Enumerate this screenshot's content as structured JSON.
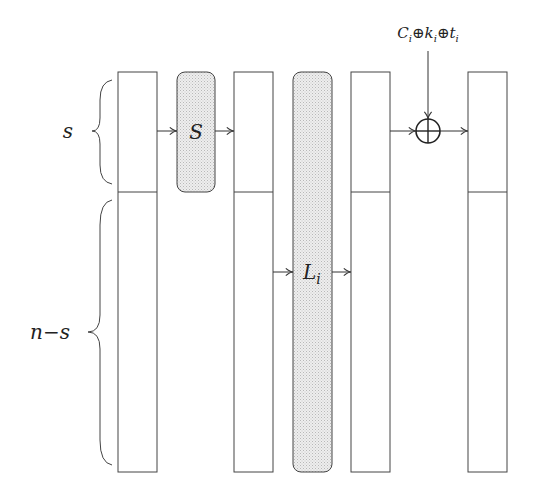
{
  "diagram": {
    "type": "block-cipher-round",
    "labels": {
      "s_brace": "s",
      "ns_brace": "n−s",
      "sbox": "S",
      "linear": "L",
      "linear_sub": "i",
      "xor_input": {
        "parts": [
          {
            "base": "C",
            "sub": "i"
          },
          {
            "op": "⊕"
          },
          {
            "base": "k",
            "sub": "i"
          },
          {
            "op": "⊕"
          },
          {
            "base": "t",
            "sub": "i"
          }
        ]
      }
    },
    "colors": {
      "stroke": "#444444",
      "op_fill": "#e4e4e4",
      "background": "#ffffff"
    },
    "columns": 4,
    "operations": [
      "S-box on top s bits",
      "Linear layer L_i on all bits",
      "XOR with C_i ⊕ k_i ⊕ t_i on top s bits"
    ]
  }
}
